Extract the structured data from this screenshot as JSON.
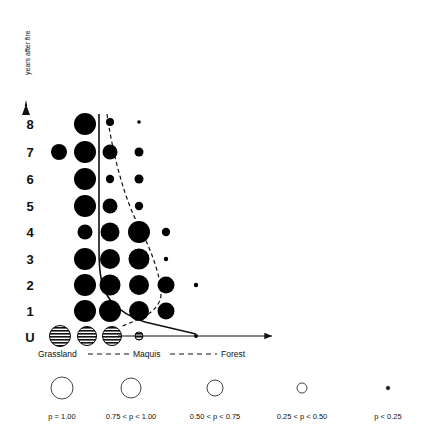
{
  "figure": {
    "background": "#ffffff",
    "ink": "#000000"
  },
  "axes": {
    "y_title": "years after fire",
    "y_ticks": [
      "8",
      "7",
      "6",
      "5",
      "4",
      "3",
      "2",
      "1",
      "U"
    ],
    "y_arrow_icon": "up-arrow-icon",
    "x_gradient": {
      "left_label": "Grassland",
      "mid_label": "Maquis",
      "right_label": "Forest",
      "connector_style": "dashed"
    },
    "x_arrow_icon": "right-arrow-icon"
  },
  "chart_data": {
    "type": "scatter",
    "title": "",
    "xlabel": "",
    "ylabel": "years after fire",
    "grid": false,
    "legend_position": "bottom",
    "x_categories": [
      "Grassland",
      "Maquis",
      "Forest"
    ],
    "x_positions": [
      58,
      85,
      110,
      138,
      168,
      196,
      226
    ],
    "y_categories": [
      "8",
      "7",
      "6",
      "5",
      "4",
      "3",
      "2",
      "1",
      "U"
    ],
    "size_classes": [
      {
        "class": "p1",
        "label": "p = 1.00",
        "radius": 11.0
      },
      {
        "class": "p2",
        "label": "0.75 < p < 1.00",
        "radius": 9.0
      },
      {
        "class": "p3",
        "label": "0.50 < p < 0.75",
        "radius": 6.5
      },
      {
        "class": "p4",
        "label": "0.25 < p < 0.50",
        "radius": 4.0
      },
      {
        "class": "p5",
        "label": "p < 0.25",
        "radius": 1.8
      }
    ],
    "points": [
      {
        "row": "8",
        "col": 1,
        "cx": 85,
        "cy": 124,
        "r": 11.0,
        "p_class": "p1",
        "fill": "solid"
      },
      {
        "row": "8",
        "col": 2,
        "cx": 110,
        "cy": 122,
        "r": 4.0,
        "p_class": "p4",
        "fill": "solid"
      },
      {
        "row": "8",
        "col": 3,
        "cx": 139,
        "cy": 122,
        "r": 1.8,
        "p_class": "p5",
        "fill": "solid"
      },
      {
        "row": "7",
        "col": 0,
        "cx": 59,
        "cy": 152,
        "r": 8.0,
        "p_class": "p2",
        "fill": "solid"
      },
      {
        "row": "7",
        "col": 1,
        "cx": 85,
        "cy": 152,
        "r": 11.0,
        "p_class": "p1",
        "fill": "solid"
      },
      {
        "row": "7",
        "col": 2,
        "cx": 110,
        "cy": 152,
        "r": 7.5,
        "p_class": "p3",
        "fill": "solid"
      },
      {
        "row": "7",
        "col": 3,
        "cx": 139,
        "cy": 152,
        "r": 4.5,
        "p_class": "p4",
        "fill": "solid"
      },
      {
        "row": "6",
        "col": 1,
        "cx": 85,
        "cy": 179,
        "r": 11.0,
        "p_class": "p1",
        "fill": "solid"
      },
      {
        "row": "6",
        "col": 2,
        "cx": 110,
        "cy": 179,
        "r": 4.2,
        "p_class": "p4",
        "fill": "solid"
      },
      {
        "row": "6",
        "col": 3,
        "cx": 139,
        "cy": 179,
        "r": 4.5,
        "p_class": "p4",
        "fill": "solid"
      },
      {
        "row": "5",
        "col": 1,
        "cx": 85,
        "cy": 206,
        "r": 11.0,
        "p_class": "p1",
        "fill": "solid"
      },
      {
        "row": "5",
        "col": 2,
        "cx": 110,
        "cy": 206,
        "r": 7.5,
        "p_class": "p3",
        "fill": "solid"
      },
      {
        "row": "5",
        "col": 3,
        "cx": 139,
        "cy": 206,
        "r": 4.2,
        "p_class": "p4",
        "fill": "solid"
      },
      {
        "row": "4",
        "col": 1,
        "cx": 85,
        "cy": 232,
        "r": 7.5,
        "p_class": "p3",
        "fill": "solid"
      },
      {
        "row": "4",
        "col": 2,
        "cx": 110,
        "cy": 232,
        "r": 9.5,
        "p_class": "p2",
        "fill": "solid"
      },
      {
        "row": "4",
        "col": 3,
        "cx": 139,
        "cy": 232,
        "r": 11.0,
        "p_class": "p1",
        "fill": "solid"
      },
      {
        "row": "4",
        "col": 4,
        "cx": 166,
        "cy": 232,
        "r": 4.2,
        "p_class": "p4",
        "fill": "solid"
      },
      {
        "row": "3",
        "col": 1,
        "cx": 85,
        "cy": 259,
        "r": 11.0,
        "p_class": "p1",
        "fill": "solid"
      },
      {
        "row": "3",
        "col": 2,
        "cx": 110,
        "cy": 259,
        "r": 10.0,
        "p_class": "p1",
        "fill": "solid"
      },
      {
        "row": "3",
        "col": 3,
        "cx": 139,
        "cy": 259,
        "r": 10.5,
        "p_class": "p1",
        "fill": "solid"
      },
      {
        "row": "3",
        "col": 4,
        "cx": 166,
        "cy": 259,
        "r": 2.2,
        "p_class": "p5",
        "fill": "solid"
      },
      {
        "row": "2",
        "col": 1,
        "cx": 85,
        "cy": 285,
        "r": 11.0,
        "p_class": "p1",
        "fill": "solid"
      },
      {
        "row": "2",
        "col": 2,
        "cx": 110,
        "cy": 285,
        "r": 10.5,
        "p_class": "p1",
        "fill": "solid"
      },
      {
        "row": "2",
        "col": 3,
        "cx": 139,
        "cy": 285,
        "r": 10.0,
        "p_class": "p1",
        "fill": "solid"
      },
      {
        "row": "2",
        "col": 4,
        "cx": 166,
        "cy": 285,
        "r": 8.5,
        "p_class": "p2",
        "fill": "solid"
      },
      {
        "row": "2",
        "col": 5,
        "cx": 196,
        "cy": 285,
        "r": 2.2,
        "p_class": "p5",
        "fill": "solid"
      },
      {
        "row": "1",
        "col": 1,
        "cx": 85,
        "cy": 311,
        "r": 11.0,
        "p_class": "p1",
        "fill": "solid"
      },
      {
        "row": "1",
        "col": 2,
        "cx": 110,
        "cy": 311,
        "r": 11.0,
        "p_class": "p1",
        "fill": "solid"
      },
      {
        "row": "1",
        "col": 3,
        "cx": 139,
        "cy": 311,
        "r": 10.0,
        "p_class": "p1",
        "fill": "solid"
      },
      {
        "row": "1",
        "col": 4,
        "cx": 166,
        "cy": 311,
        "r": 8.5,
        "p_class": "p2",
        "fill": "solid"
      },
      {
        "row": "U",
        "col": 0,
        "cx": 60,
        "cy": 336,
        "r": 10.5,
        "p_class": "p1",
        "fill": "hatched"
      },
      {
        "row": "U",
        "col": 1,
        "cx": 87,
        "cy": 336,
        "r": 9.5,
        "p_class": "p2",
        "fill": "hatched"
      },
      {
        "row": "U",
        "col": 2,
        "cx": 112,
        "cy": 336,
        "r": 9.5,
        "p_class": "p2",
        "fill": "hatched"
      },
      {
        "row": "U",
        "col": 3,
        "cx": 139,
        "cy": 336,
        "r": 4.0,
        "p_class": "p4",
        "fill": "hatched"
      },
      {
        "row": "U",
        "col": 4,
        "cx": 196,
        "cy": 336,
        "r": 2.0,
        "p_class": "p5",
        "fill": "solid"
      }
    ],
    "overlay_curves": [
      {
        "name": "solid-boundary-curve",
        "style": "solid",
        "path": "M 99 114 L 99 250 C 99 272 101 290 112 302 C 122 313 132 318 145 322 L 196 334"
      },
      {
        "name": "dashed-boundary-curve",
        "style": "dashed",
        "path": "M 107 114 C 112 150 124 200 140 228 C 152 252 160 275 161 292 C 162 304 152 314 137 320 L 120 327"
      }
    ]
  },
  "legend": {
    "items": [
      {
        "label": "p = 1.00",
        "radius": 11.0,
        "cx": 62,
        "cy": 388
      },
      {
        "label": "0.75 < p < 1.00",
        "radius": 10.0,
        "cx": 131,
        "cy": 388
      },
      {
        "label": "0.50 < p < 0.75",
        "radius": 8.0,
        "cx": 215,
        "cy": 388
      },
      {
        "label": "0.25 < p < 0.50",
        "radius": 5.0,
        "cx": 302,
        "cy": 388
      },
      {
        "label": "p < 0.25",
        "radius": 1.8,
        "cx": 388,
        "cy": 388
      }
    ]
  }
}
